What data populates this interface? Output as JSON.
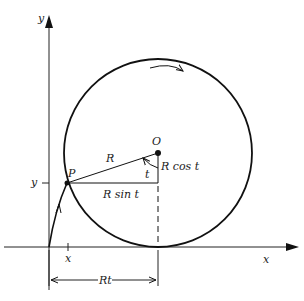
{
  "diagram": {
    "type": "cycloid-construction",
    "labels": {
      "y_axis": "y",
      "x_axis": "x",
      "center": "O",
      "point": "P",
      "radius": "R",
      "angle": "t",
      "vertical_leg": "R cos t",
      "horizontal_leg": "R sin t",
      "y_tick": "y",
      "x_tick": "x",
      "arc_length": "Rt"
    },
    "colors": {
      "ink": "#111111",
      "background": "#ffffff"
    }
  }
}
